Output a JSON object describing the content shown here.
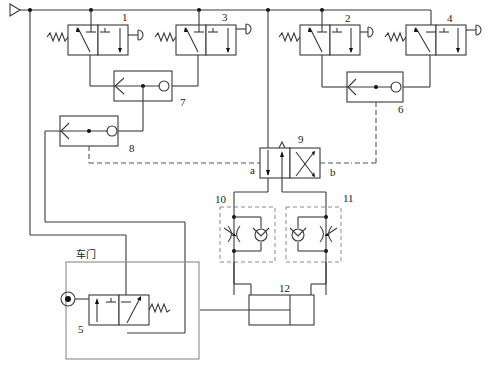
{
  "diagram": {
    "type": "pneumatic-circuit",
    "labels": {
      "v1": "1",
      "v2": "2",
      "v3": "3",
      "v4": "4",
      "v5": "5",
      "v6": "6",
      "v7": "7",
      "v8": "8",
      "v9": "9",
      "v10": "10",
      "v11": "11",
      "v12": "12",
      "port_a": "a",
      "port_b": "b",
      "door": "车门"
    },
    "components": [
      {
        "id": "1",
        "kind": "3/2 push-button valve, spring return"
      },
      {
        "id": "2",
        "kind": "3/2 push-button valve, spring return"
      },
      {
        "id": "3",
        "kind": "3/2 push-button valve, spring return"
      },
      {
        "id": "4",
        "kind": "3/2 push-button valve, spring return"
      },
      {
        "id": "5",
        "kind": "3/2 roller-operated valve (door)"
      },
      {
        "id": "6",
        "kind": "shuttle valve (OR)"
      },
      {
        "id": "7",
        "kind": "shuttle valve (OR)"
      },
      {
        "id": "8",
        "kind": "shuttle valve (OR)"
      },
      {
        "id": "9",
        "kind": "4/2 pilot-operated directional valve"
      },
      {
        "id": "10",
        "kind": "one-way flow control valve"
      },
      {
        "id": "11",
        "kind": "one-way flow control valve"
      },
      {
        "id": "12",
        "kind": "double-acting cylinder"
      }
    ]
  }
}
